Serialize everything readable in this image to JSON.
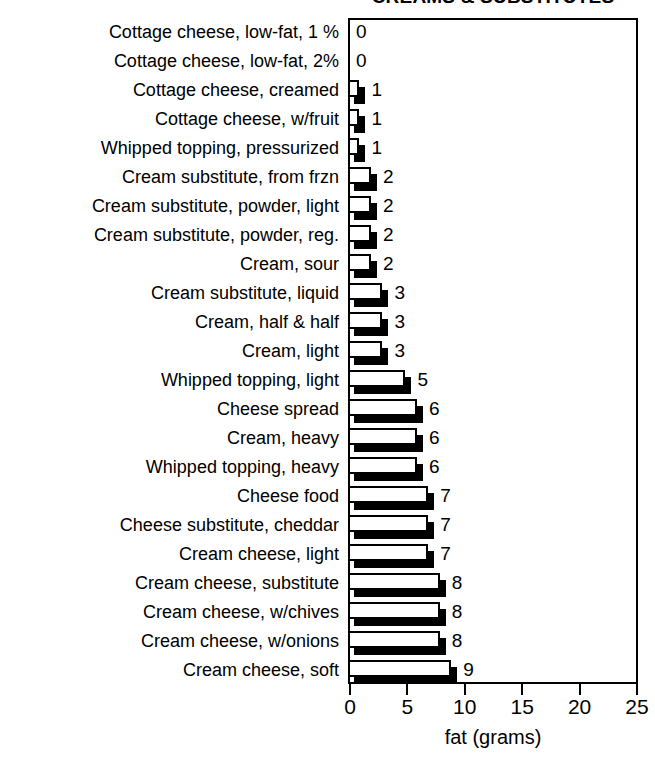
{
  "chart_data": {
    "type": "bar",
    "orientation": "horizontal",
    "title": "CREAMS & SUBSTITUTES",
    "xlabel": "fat (grams)",
    "ylabel": "",
    "xlim": [
      0,
      25
    ],
    "xticks": [
      0,
      5,
      10,
      15,
      20,
      25
    ],
    "grid": false,
    "legend": null,
    "value_labels_shown": true,
    "categories": [
      "Cottage cheese, low-fat, 1 %",
      "Cottage cheese, low-fat, 2%",
      "Cottage cheese, creamed",
      "Cottage cheese, w/fruit",
      "Whipped topping, pressurized",
      "Cream substitute, from frzn",
      "Cream substitute, powder, light",
      "Cream substitute, powder, reg.",
      "Cream, sour",
      "Cream substitute, liquid",
      "Cream, half & half",
      "Cream, light",
      "Whipped topping, light",
      "Cheese spread",
      "Cream, heavy",
      "Whipped topping, heavy",
      "Cheese food",
      "Cheese substitute, cheddar",
      "Cream cheese, light",
      "Cream cheese, substitute",
      "Cream cheese, w/chives",
      "Cream cheese, w/onions",
      "Cream cheese, soft"
    ],
    "values": [
      0,
      0,
      1,
      1,
      1,
      2,
      2,
      2,
      2,
      3,
      3,
      3,
      5,
      6,
      6,
      6,
      7,
      7,
      7,
      8,
      8,
      8,
      9
    ],
    "value_label_text": [
      "0",
      "0",
      "1",
      "1",
      "1",
      "2",
      "2",
      "2",
      "2",
      "3",
      "3",
      "3",
      "5",
      "6",
      "6",
      "6",
      "7",
      "7",
      "7",
      "8",
      "8",
      "8",
      "9"
    ]
  },
  "style": {
    "bar_face_color": "#ffffff",
    "bar_edge_color": "#000000",
    "bar_shadow_color": "#000000",
    "axis_color": "#000000",
    "background": "#ffffff"
  }
}
